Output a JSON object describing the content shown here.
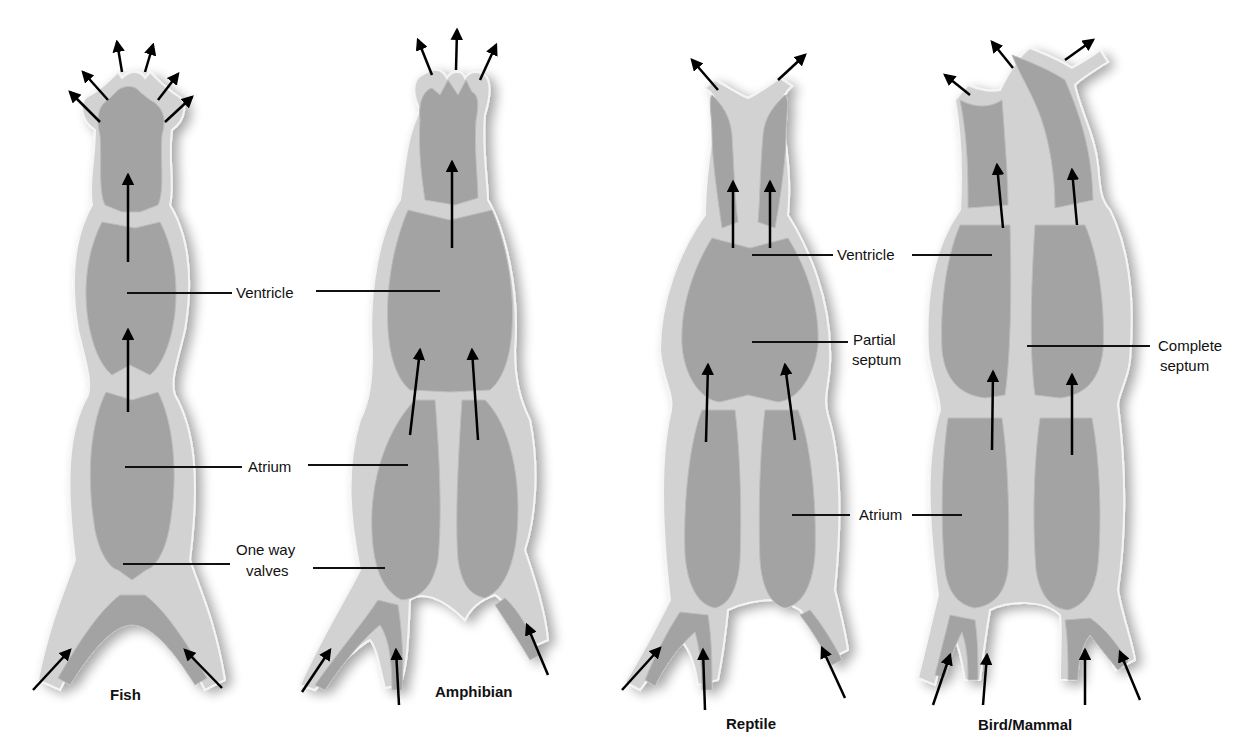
{
  "diagram": {
    "colors": {
      "chamber_fill": "#a3a3a3",
      "wall_fill": "#d2d2d2",
      "highlight": "#f4f4f4",
      "text": "#111111"
    },
    "hearts": [
      {
        "name": "Fish",
        "chambers": 2,
        "labels": [
          "Ventricle",
          "Atrium",
          "One way valves"
        ]
      },
      {
        "name": "Amphibian",
        "chambers": 3,
        "labels": []
      },
      {
        "name": "Reptile",
        "chambers": 3,
        "labels": [
          "Ventricle",
          "Partial septum",
          "Atrium"
        ]
      },
      {
        "name": "Bird/Mammal",
        "chambers": 4,
        "labels": [
          "Complete septum"
        ]
      }
    ],
    "labels": {
      "fish_ventricle": "Ventricle",
      "fish_atrium": "Atrium",
      "valves_line1": "One way",
      "valves_line2": "valves",
      "reptile_ventricle": "Ventricle",
      "partial_line1": "Partial",
      "partial_line2": "septum",
      "reptile_atrium": "Atrium",
      "complete_line1": "Complete",
      "complete_line2": "septum"
    },
    "titles": {
      "fish": "Fish",
      "amphibian": "Amphibian",
      "reptile": "Reptile",
      "bird_mammal": "Bird/Mammal"
    }
  }
}
